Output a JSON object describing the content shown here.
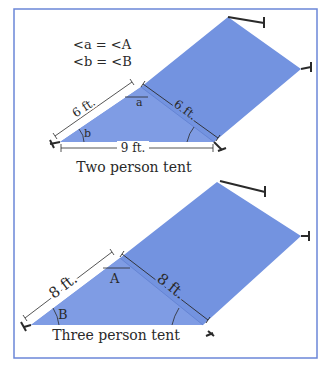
{
  "colors": {
    "tent_fill": "#7393e0",
    "tent_fill_light": "#8aa4e6",
    "frame_border": "#6b86d8",
    "line": "#2a2a2a"
  },
  "legend": {
    "line1": "<a = <A",
    "line2": "<b = <B"
  },
  "two_person_tent": {
    "caption": "Two person tent",
    "side_left": "6 ft.",
    "side_right": "6 ft.",
    "base": "9 ft.",
    "angle_top": "a",
    "angle_left": "b"
  },
  "three_person_tent": {
    "caption": "Three person tent",
    "side_left": "8 ft.",
    "side_right": "8 ft.",
    "angle_top": "A",
    "angle_left": "B"
  }
}
